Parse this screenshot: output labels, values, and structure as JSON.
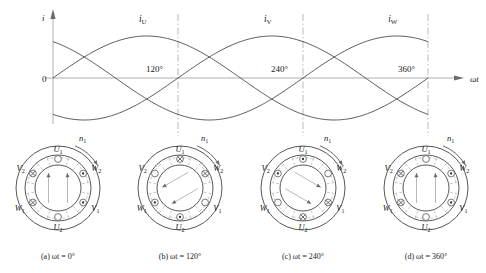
{
  "figure": {
    "axis": {
      "y_label": "i",
      "x_label": "ωt",
      "origin_label": "0"
    },
    "phase_labels": [
      {
        "name": "iU",
        "base": "i",
        "sub": "U"
      },
      {
        "name": "iV",
        "base": "i",
        "sub": "V"
      },
      {
        "name": "iW",
        "base": "i",
        "sub": "W"
      }
    ],
    "angle_ticks": [
      "120°",
      "240°",
      "360°"
    ],
    "speed_label": {
      "base": "n",
      "sub": "1"
    },
    "terminal_labels": [
      {
        "base": "U",
        "sub": "1"
      },
      {
        "base": "U",
        "sub": "2"
      },
      {
        "base": "V",
        "sub": "1"
      },
      {
        "base": "V",
        "sub": "2"
      },
      {
        "base": "W",
        "sub": "1"
      },
      {
        "base": "W",
        "sub": "2"
      }
    ],
    "captions": [
      "(a)  ωt = 0°",
      "(b)  ωt = 120°",
      "(c)  ωt = 240°",
      "(d)  ωt = 360°"
    ],
    "colors": {
      "curve": "#4a4a4a",
      "axis": "#9a9a9a",
      "dashed": "#a8a8a8",
      "stator": "#3a3a3a"
    }
  },
  "chart_data": {
    "type": "line",
    "xlabel": "ωt",
    "ylabel": "i",
    "xlim": [
      0,
      360
    ],
    "ylim": [
      -1,
      1
    ],
    "grid": false,
    "legend": "inline-labels-above-peaks",
    "xticks": [
      0,
      120,
      240,
      360
    ],
    "xticklabels": [
      "0",
      "120°",
      "240°",
      "360°"
    ],
    "yticks": [
      0
    ],
    "yticklabels": [
      "0"
    ],
    "x": [
      0,
      30,
      60,
      90,
      120,
      150,
      180,
      210,
      240,
      270,
      300,
      330,
      360
    ],
    "series": [
      {
        "name": "iU",
        "phase_deg": 0,
        "values": [
          0,
          0.5,
          0.866,
          1,
          0.866,
          0.5,
          0,
          -0.5,
          -0.866,
          -1,
          -0.866,
          -0.5,
          0
        ]
      },
      {
        "name": "iV",
        "phase_deg": -120,
        "values": [
          -0.866,
          -1,
          -0.866,
          -0.5,
          0,
          0.5,
          0.866,
          1,
          0.866,
          0.5,
          0,
          -0.5,
          -0.866
        ]
      },
      {
        "name": "iW",
        "phase_deg": 120,
        "values": [
          0.866,
          0.5,
          0,
          -0.5,
          -0.866,
          -1,
          -0.866,
          -0.5,
          0,
          0.5,
          0.866,
          1,
          0.866
        ]
      }
    ],
    "annotations": [
      {
        "text": "iU",
        "x": 90,
        "y": 1.0
      },
      {
        "text": "iV",
        "x": 210,
        "y": 1.0
      },
      {
        "text": "iW",
        "x": 330,
        "y": 1.0
      }
    ]
  },
  "motors": [
    {
      "id": "motor-a",
      "caption": "(a)  ωt = 0°",
      "omega_t": "0°",
      "field_direction": "up",
      "field_angle_deg": 0,
      "coils": [
        {
          "label": "U1",
          "base": "U",
          "sub": "1",
          "angle_deg": 90,
          "current": "none"
        },
        {
          "label": "W2",
          "base": "W",
          "sub": "2",
          "angle_deg": 30,
          "current": "out"
        },
        {
          "label": "V1",
          "base": "V",
          "sub": "1",
          "angle_deg": -30,
          "current": "out"
        },
        {
          "label": "U2",
          "base": "U",
          "sub": "2",
          "angle_deg": -90,
          "current": "none"
        },
        {
          "label": "W1",
          "base": "W",
          "sub": "1",
          "angle_deg": -150,
          "current": "in"
        },
        {
          "label": "V2",
          "base": "V",
          "sub": "2",
          "angle_deg": 150,
          "current": "in"
        }
      ]
    },
    {
      "id": "motor-b",
      "caption": "(b)  ωt = 120°",
      "omega_t": "120°",
      "field_direction": "rotated-120",
      "field_angle_deg": 120,
      "coils": [
        {
          "label": "U1",
          "base": "U",
          "sub": "1",
          "angle_deg": 90,
          "current": "in"
        },
        {
          "label": "W2",
          "base": "W",
          "sub": "2",
          "angle_deg": 30,
          "current": "in"
        },
        {
          "label": "V1",
          "base": "V",
          "sub": "1",
          "angle_deg": -30,
          "current": "none"
        },
        {
          "label": "U2",
          "base": "U",
          "sub": "2",
          "angle_deg": -90,
          "current": "out"
        },
        {
          "label": "W1",
          "base": "W",
          "sub": "1",
          "angle_deg": -150,
          "current": "out"
        },
        {
          "label": "V2",
          "base": "V",
          "sub": "2",
          "angle_deg": 150,
          "current": "none"
        }
      ]
    },
    {
      "id": "motor-c",
      "caption": "(c)  ωt = 240°",
      "omega_t": "240°",
      "field_direction": "rotated-240",
      "field_angle_deg": 240,
      "coils": [
        {
          "label": "U1",
          "base": "U",
          "sub": "1",
          "angle_deg": 90,
          "current": "out"
        },
        {
          "label": "W2",
          "base": "W",
          "sub": "2",
          "angle_deg": 30,
          "current": "none"
        },
        {
          "label": "V1",
          "base": "V",
          "sub": "1",
          "angle_deg": -30,
          "current": "in"
        },
        {
          "label": "U2",
          "base": "U",
          "sub": "2",
          "angle_deg": -90,
          "current": "in"
        },
        {
          "label": "W1",
          "base": "W",
          "sub": "1",
          "angle_deg": -150,
          "current": "none"
        },
        {
          "label": "V2",
          "base": "V",
          "sub": "2",
          "angle_deg": 150,
          "current": "out"
        }
      ]
    },
    {
      "id": "motor-d",
      "caption": "(d)  ωt = 360°",
      "omega_t": "360°",
      "field_direction": "up",
      "field_angle_deg": 360,
      "coils": [
        {
          "label": "U1",
          "base": "U",
          "sub": "1",
          "angle_deg": 90,
          "current": "none"
        },
        {
          "label": "W2",
          "base": "W",
          "sub": "2",
          "angle_deg": 30,
          "current": "out"
        },
        {
          "label": "V1",
          "base": "V",
          "sub": "1",
          "angle_deg": -30,
          "current": "out"
        },
        {
          "label": "U2",
          "base": "U",
          "sub": "2",
          "angle_deg": -90,
          "current": "none"
        },
        {
          "label": "W1",
          "base": "W",
          "sub": "1",
          "angle_deg": -150,
          "current": "in"
        },
        {
          "label": "V2",
          "base": "V",
          "sub": "2",
          "angle_deg": 150,
          "current": "in"
        }
      ]
    }
  ]
}
